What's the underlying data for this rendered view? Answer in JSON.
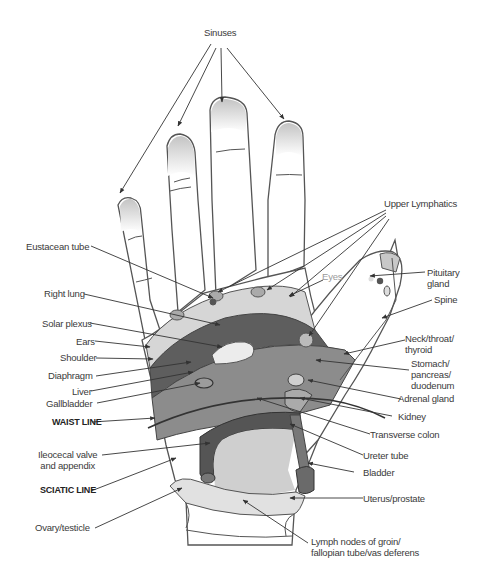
{
  "diagram": {
    "colors": {
      "skin": "#ffffff",
      "outline": "#555555",
      "fingertip_shade": "#c8c8c8",
      "band_light": "#d6d6d6",
      "band_medium": "#8c8c8c",
      "band_dark": "#5e5e5e",
      "palm_lower": "#cfcfcf",
      "colon": "#555555",
      "bladder": "#6a6a6a",
      "arrow": "#333333",
      "text": "#3a3a3a",
      "eyes_text": "#9a9a9a"
    },
    "labels": {
      "sinuses": "Sinuses",
      "upper_lymphatics": "Upper Lymphatics",
      "eustacean_tube": "Eustacean tube",
      "eyes": "Eyes",
      "pituitary_gland": "Pituitary\ngland",
      "right_lung": "Right lung",
      "spine": "Spine",
      "solar_plexus": "Solar plexus",
      "ears": "Ears",
      "neck_throat_thyroid": "Neck/throat/\nthyroid",
      "shoulder": "Shoulder",
      "stomach_pancreas_duodenum": "Stomach/\npancreas/\nduodenum",
      "diaphragm": "Diaphragm",
      "liver": "Liver",
      "adrenal_gland": "Adrenal gland",
      "gallbladder": "Gallbladder",
      "kidney": "Kidney",
      "waist_line": "WAIST LINE",
      "transverse_colon": "Transverse colon",
      "ileocecal_valve": "Ileocecal valve\nand appendix",
      "ureter_tube": "Ureter tube",
      "bladder": "Bladder",
      "sciatic_line": "SCIATIC LINE",
      "uterus_prostate": "Uterus/prostate",
      "ovary_testicle": "Ovary/testicle",
      "lymph_nodes": "Lymph nodes of groin/\nfallopian tube/vas deferens"
    }
  }
}
